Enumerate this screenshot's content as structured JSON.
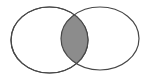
{
  "diagram": {
    "type": "venn",
    "sets": [
      {
        "id": "A",
        "shape": "ellipse",
        "cx": 49.5,
        "cy": 40,
        "rx": 38.5,
        "ry": 33,
        "fill": "#ffffff",
        "stroke": "#474747"
      },
      {
        "id": "B",
        "shape": "ellipse",
        "cx": 100,
        "cy": 38.5,
        "rx": 39,
        "ry": 31.5,
        "fill": "none",
        "stroke": "#474747"
      }
    ],
    "intersection": {
      "shaded": true,
      "fill": "#8c8c8c",
      "stroke": "#3a3a3a"
    },
    "labels": []
  }
}
